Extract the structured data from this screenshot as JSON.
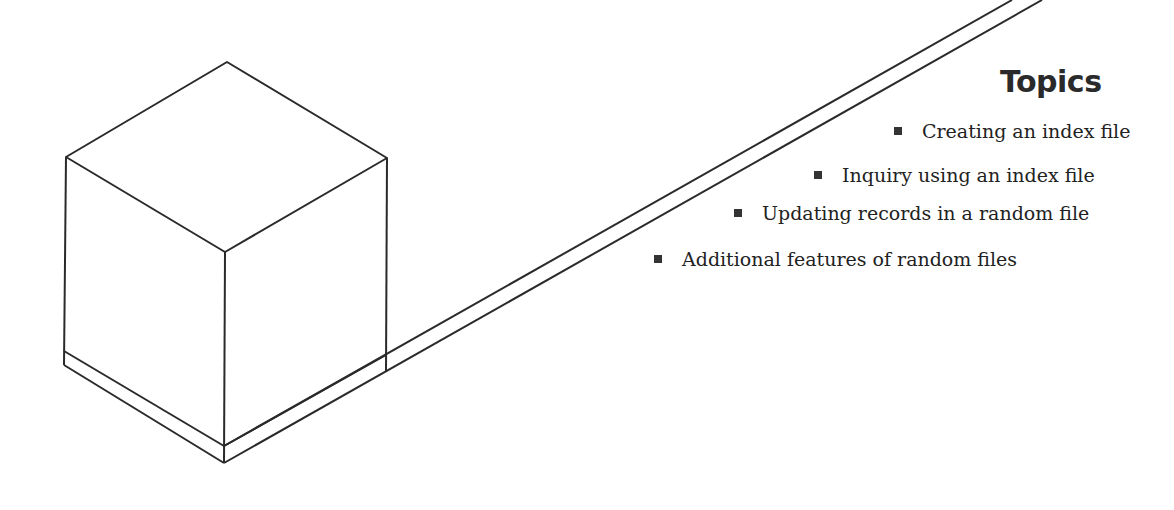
{
  "heading": "Topics",
  "topics": [
    {
      "label": "Creating an index file",
      "x": 894,
      "y": 120
    },
    {
      "label": "Inquiry using an index file",
      "x": 814,
      "y": 164
    },
    {
      "label": "Updating records in a random file",
      "x": 734,
      "y": 202
    },
    {
      "label": "Additional features of random files",
      "x": 654,
      "y": 248
    }
  ],
  "figure": {
    "stroke_color": "#2a2a2a"
  }
}
